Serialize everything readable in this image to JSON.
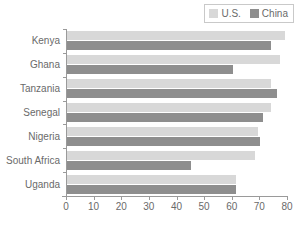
{
  "chart_data": {
    "type": "bar",
    "orientation": "horizontal",
    "title": "",
    "xlabel": "",
    "ylabel": "",
    "xlim": [
      0,
      80
    ],
    "xticks": [
      0,
      10,
      20,
      30,
      40,
      50,
      60,
      70,
      80
    ],
    "grid": false,
    "legend_position": "top-right",
    "categories": [
      "Kenya",
      "Ghana",
      "Tanzania",
      "Senegal",
      "Nigeria",
      "South Africa",
      "Uganda"
    ],
    "series": [
      {
        "name": "U.S.",
        "color": "#d8d8d8",
        "values": [
          79,
          77,
          74,
          74,
          69,
          68,
          61
        ]
      },
      {
        "name": "China",
        "color": "#8e8e8e",
        "values": [
          74,
          60,
          76,
          71,
          70,
          45,
          61
        ]
      }
    ]
  },
  "legend": {
    "entries": [
      {
        "label": "U.S.",
        "swatch": "legend-swatch-us"
      },
      {
        "label": "China",
        "swatch": "legend-swatch-china"
      }
    ]
  },
  "axis": {
    "tick_labels": [
      "0",
      "10",
      "20",
      "30",
      "40",
      "50",
      "60",
      "70",
      "80"
    ]
  }
}
